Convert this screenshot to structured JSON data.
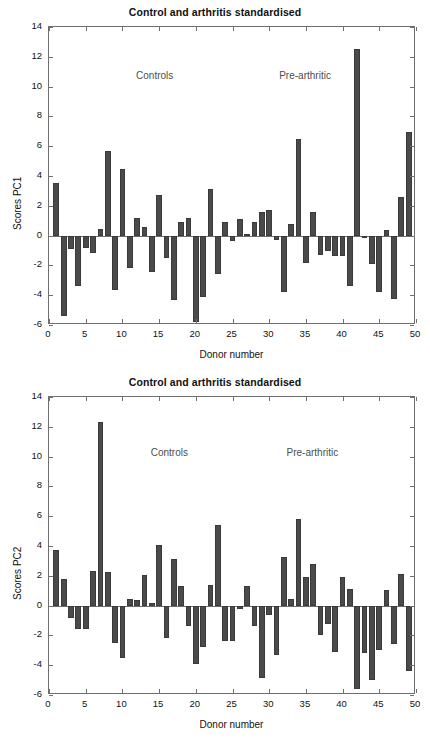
{
  "figure": {
    "panels": [
      {
        "name": "pc1",
        "title": "Control and arthritis standardised",
        "xlabel": "Donor number",
        "ylabel": "Scores PC1",
        "annotations": [
          {
            "text": "Controls",
            "x": 12.0,
            "y": 10.6
          },
          {
            "text": "Pre-arthritic",
            "x": 31.5,
            "y": 10.6
          }
        ]
      },
      {
        "name": "pc2",
        "title": "Control and arthritis standardised",
        "xlabel": "Donor number",
        "ylabel": "Scores PC2",
        "annotations": [
          {
            "text": "Controls",
            "x": 14.0,
            "y": 10.1
          },
          {
            "text": "Pre-arthritic",
            "x": 32.5,
            "y": 10.1
          }
        ]
      }
    ],
    "bar_color": "#4a4a4a",
    "axis_color": "#6f6f6f",
    "annotation_color": "#4d4d4d"
  },
  "chart_data": [
    {
      "type": "bar",
      "title": "Control and arthritis standardised",
      "xlabel": "Donor number",
      "ylabel": "Scores PC1",
      "xlim": [
        0,
        50
      ],
      "ylim": [
        -6,
        14
      ],
      "yticks": [
        -6,
        -4,
        -2,
        0,
        2,
        4,
        6,
        8,
        10,
        12,
        14
      ],
      "xticks": [
        0,
        5,
        10,
        15,
        20,
        25,
        30,
        35,
        40,
        45,
        50
      ],
      "grid": false,
      "legend": "none",
      "annotations": [
        "Controls",
        "Pre-arthritic"
      ],
      "categories": [
        1,
        2,
        3,
        4,
        5,
        6,
        7,
        8,
        9,
        10,
        11,
        12,
        13,
        14,
        15,
        16,
        17,
        18,
        19,
        20,
        21,
        22,
        23,
        24,
        25,
        26,
        27,
        28,
        29,
        30,
        31,
        32,
        33,
        34,
        35,
        36,
        37,
        38,
        39,
        40,
        41,
        42,
        43,
        44,
        45,
        46,
        47,
        48,
        49
      ],
      "values": [
        3.55,
        -5.4,
        -0.9,
        -3.4,
        -0.85,
        -1.15,
        0.42,
        5.65,
        -3.65,
        4.45,
        -2.15,
        1.15,
        0.6,
        -2.45,
        2.7,
        -1.5,
        -4.3,
        0.9,
        1.15,
        -5.8,
        -4.1,
        3.1,
        -2.6,
        0.9,
        -0.35,
        1.1,
        0.1,
        0.9,
        1.6,
        1.75,
        -0.3,
        -3.8,
        0.75,
        6.45,
        -1.85,
        1.6,
        -1.3,
        -1.05,
        -1.35,
        -1.4,
        -3.35,
        12.55,
        -0.1,
        -1.9,
        -3.8,
        0.4,
        -4.25,
        2.6,
        6.95
      ]
    },
    {
      "type": "bar",
      "title": "Control and arthritis standardised",
      "xlabel": "Donor number",
      "ylabel": "Scores PC2",
      "xlim": [
        0,
        50
      ],
      "ylim": [
        -6,
        14
      ],
      "yticks": [
        -6,
        -4,
        -2,
        0,
        2,
        4,
        6,
        8,
        10,
        12,
        14
      ],
      "xticks": [
        0,
        5,
        10,
        15,
        20,
        25,
        30,
        35,
        40,
        45,
        50
      ],
      "grid": false,
      "legend": "none",
      "annotations": [
        "Controls",
        "Pre-arthritic"
      ],
      "categories": [
        1,
        2,
        3,
        4,
        5,
        6,
        7,
        8,
        9,
        10,
        11,
        12,
        13,
        14,
        15,
        16,
        17,
        18,
        19,
        20,
        21,
        22,
        23,
        24,
        25,
        26,
        27,
        28,
        29,
        30,
        31,
        32,
        33,
        34,
        35,
        36,
        37,
        38,
        39,
        40,
        41,
        42,
        43,
        44,
        45,
        46,
        47,
        48,
        49
      ],
      "values": [
        3.75,
        1.8,
        -0.85,
        -1.6,
        -1.6,
        2.35,
        12.3,
        2.25,
        -2.5,
        -3.5,
        0.45,
        0.4,
        2.05,
        0.15,
        4.1,
        -2.2,
        3.1,
        1.3,
        -1.4,
        -3.9,
        -2.8,
        1.35,
        5.4,
        -2.35,
        -2.4,
        -0.2,
        1.3,
        -1.4,
        -4.85,
        -0.65,
        -3.3,
        3.25,
        0.45,
        5.8,
        1.95,
        2.8,
        -2.0,
        -1.25,
        -3.1,
        1.95,
        1.1,
        -5.6,
        -3.2,
        -5.0,
        -3.0,
        1.05,
        -2.55,
        2.1,
        -4.4
      ]
    }
  ]
}
